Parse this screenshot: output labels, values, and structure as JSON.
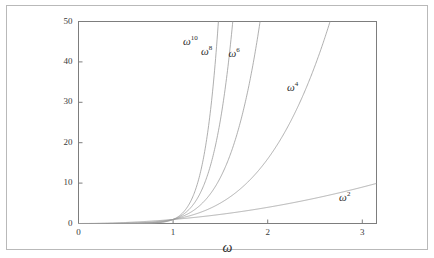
{
  "figure": {
    "background_color": "#ffffff",
    "border_color": "#b9b9b9",
    "axis_color": "#7d7d7d",
    "curve_color": "#9a9a9a",
    "text_color": "#2b2b2b"
  },
  "chart_data": {
    "type": "line",
    "title": "",
    "xlabel": "ω",
    "ylabel": "",
    "xlim": [
      0,
      3.15
    ],
    "ylim": [
      0,
      50
    ],
    "xticks": [
      0,
      1,
      2,
      3
    ],
    "xticklabels": [
      "0",
      "1",
      "2",
      "3"
    ],
    "yticks": [
      0,
      10,
      20,
      30,
      40,
      50
    ],
    "yticklabels": [
      "0",
      "10",
      "20",
      "30",
      "40",
      "50"
    ],
    "grid": false,
    "legend": "none",
    "annotations_inline": true,
    "series": [
      {
        "name": "ω²",
        "label_base": "ω",
        "label_exponent": "2",
        "exponent": 2,
        "label_x": 2.85,
        "label_y": 6.2,
        "x": [
          0,
          0.25,
          0.5,
          0.75,
          1.0,
          1.25,
          1.5,
          1.75,
          2.0,
          2.25,
          2.5,
          2.75,
          3.0,
          3.15
        ],
        "y": [
          0,
          0.06,
          0.25,
          0.56,
          1.0,
          1.56,
          2.25,
          3.06,
          4.0,
          5.06,
          6.25,
          7.56,
          9.0,
          9.92
        ]
      },
      {
        "name": "ω⁴",
        "label_base": "ω",
        "label_exponent": "4",
        "exponent": 4,
        "label_x": 2.3,
        "label_y": 33.5,
        "x": [
          0,
          0.4,
          0.8,
          1.0,
          1.2,
          1.4,
          1.6,
          1.8,
          2.0,
          2.2,
          2.4,
          2.66
        ],
        "y": [
          0,
          0.03,
          0.41,
          1.0,
          2.07,
          3.84,
          6.55,
          10.5,
          16.0,
          23.4,
          33.2,
          50.0
        ]
      },
      {
        "name": "ω⁶",
        "label_base": "ω",
        "label_exponent": "6",
        "exponent": 6,
        "label_x": 1.68,
        "label_y": 42.0,
        "x": [
          0,
          0.4,
          0.8,
          1.0,
          1.1,
          1.2,
          1.3,
          1.4,
          1.5,
          1.6,
          1.7,
          1.8,
          1.92
        ],
        "y": [
          0,
          0.004,
          0.26,
          1.0,
          1.77,
          2.99,
          4.83,
          7.53,
          11.4,
          16.8,
          24.1,
          34.0,
          50.0
        ]
      },
      {
        "name": "ω⁸",
        "label_base": "ω",
        "label_exponent": "8",
        "exponent": 8,
        "label_x": 1.39,
        "label_y": 42.5,
        "x": [
          0,
          0.4,
          0.8,
          1.0,
          1.1,
          1.2,
          1.3,
          1.4,
          1.5,
          1.6,
          1.65
        ],
        "y": [
          0,
          0.00066,
          0.168,
          1.0,
          2.14,
          4.3,
          8.16,
          14.76,
          25.6,
          42.9,
          50.0
        ]
      },
      {
        "name": "ω¹⁰",
        "label_base": "ω",
        "label_exponent": "10",
        "exponent": 10,
        "label_x": 1.2,
        "label_y": 45.0,
        "x": [
          0,
          0.4,
          0.8,
          1.0,
          1.08,
          1.16,
          1.24,
          1.32,
          1.4,
          1.48,
          1.52
        ],
        "y": [
          0,
          0.0001,
          0.107,
          1.0,
          2.16,
          4.41,
          8.59,
          16.1,
          28.9,
          50.3,
          50.0
        ]
      }
    ]
  }
}
